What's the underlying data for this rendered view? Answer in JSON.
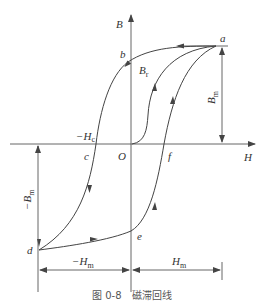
{
  "figure": {
    "caption": {
      "number": "图 0-8",
      "title": "磁滞回线"
    },
    "axes": {
      "x_label": "H",
      "y_label": "B",
      "origin_label": "O"
    },
    "points": {
      "a": "a",
      "b": "b",
      "c": "c",
      "d": "d",
      "e": "e",
      "f": "f"
    },
    "annotations": {
      "remanence": {
        "main": "B",
        "sub": "r"
      },
      "coercivity": {
        "main": "−H",
        "sub": "c"
      },
      "max_flux": {
        "main": "B",
        "sub": "m"
      },
      "neg_max_flux": {
        "main": "−B",
        "sub": "m"
      },
      "max_field": {
        "main": "H",
        "sub": "m"
      },
      "neg_max_field": {
        "main": "−H",
        "sub": "m"
      }
    },
    "colors": {
      "line": "#444444",
      "text": "#333333",
      "background": "#ffffff"
    }
  }
}
